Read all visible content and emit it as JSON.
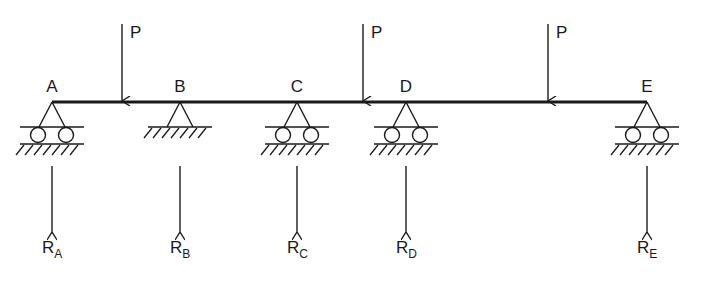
{
  "diagram": {
    "type": "continuous-beam",
    "stroke_color": "#1a1a1a",
    "beam": {
      "x1": 52,
      "x2": 647,
      "y": 102
    },
    "supports": [
      {
        "id": "A",
        "label": "A",
        "kind": "roller",
        "x": 52,
        "reaction_main": "R",
        "reaction_sub": "A"
      },
      {
        "id": "B",
        "label": "B",
        "kind": "pin",
        "x": 180,
        "reaction_main": "R",
        "reaction_sub": "B"
      },
      {
        "id": "C",
        "label": "C",
        "kind": "roller",
        "x": 297,
        "reaction_main": "R",
        "reaction_sub": "C"
      },
      {
        "id": "D",
        "label": "D",
        "kind": "roller",
        "x": 406,
        "reaction_main": "R",
        "reaction_sub": "D"
      },
      {
        "id": "E",
        "label": "E",
        "kind": "roller",
        "x": 647,
        "reaction_main": "R",
        "reaction_sub": "E"
      }
    ],
    "loads": [
      {
        "label": "P",
        "x": 122
      },
      {
        "label": "P",
        "x": 363
      },
      {
        "label": "P",
        "x": 548
      }
    ]
  }
}
